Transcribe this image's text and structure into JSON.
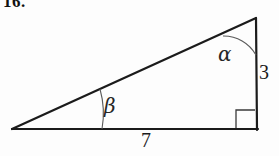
{
  "figure": {
    "problem_number": "16.",
    "type": "right-triangle",
    "background_color": "#fdfdfd",
    "stroke_color": "#1b1b1b",
    "arc_color": "#5a5a5a",
    "vertices": {
      "left": {
        "x": 12,
        "y": 129
      },
      "bottom_right": {
        "x": 257,
        "y": 129
      },
      "apex": {
        "x": 256,
        "y": 18
      }
    },
    "sides": [
      {
        "name": "base",
        "label": "7",
        "from": "left",
        "to": "bottom_right"
      },
      {
        "name": "vertical-leg",
        "label": "3",
        "from": "bottom_right",
        "to": "apex"
      },
      {
        "name": "hypotenuse",
        "label": "",
        "from": "left",
        "to": "apex"
      }
    ],
    "angles": [
      {
        "name": "alpha",
        "label": "α",
        "at": "apex",
        "marker": "arc"
      },
      {
        "name": "beta",
        "label": "β",
        "at": "left",
        "marker": "arc"
      },
      {
        "name": "gamma",
        "label": "",
        "at": "bottom_right",
        "marker": "right-angle-square"
      }
    ],
    "labels": {
      "vertical_side": "3",
      "base_side": "7",
      "apex_angle": "α",
      "left_angle": "β"
    }
  }
}
